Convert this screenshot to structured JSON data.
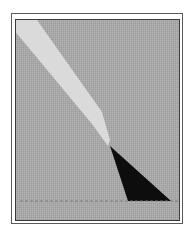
{
  "figure": {
    "type": "shadow-projection-diagram",
    "colors": {
      "background": "#a9a9a9",
      "beam": "#dcdcdc",
      "shadow": "#0d0d0d",
      "frame": "#4a4a4a",
      "ground_line": "#7a7a7a"
    },
    "elements": [
      {
        "name": "light-beam",
        "shape": "polygon",
        "points": [
          [
            16,
            20
          ],
          [
            37,
            20
          ],
          [
            110,
            115
          ],
          [
            113,
            145
          ],
          [
            107,
            145
          ],
          [
            91,
            122
          ],
          [
            16,
            40
          ]
        ]
      },
      {
        "name": "shadow-triangle",
        "shape": "polygon",
        "points": [
          [
            110,
            146
          ],
          [
            128,
            201
          ],
          [
            171,
            201
          ]
        ]
      },
      {
        "name": "ground-line",
        "shape": "dashed-line",
        "from": [
          20,
          201
        ],
        "to": [
          180,
          201
        ]
      }
    ]
  }
}
